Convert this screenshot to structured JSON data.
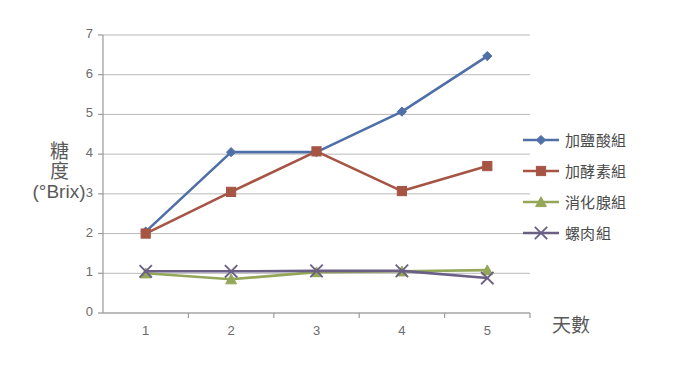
{
  "chart_data": {
    "type": "line",
    "title": "",
    "xlabel": "天數",
    "ylabel": "糖度\n(°Brix)",
    "ylabel_lines": [
      "糖",
      "度",
      "(°Brix)"
    ],
    "x": [
      1,
      2,
      3,
      4,
      5
    ],
    "categories": [
      "1",
      "2",
      "3",
      "4",
      "5"
    ],
    "xtick_labels": [
      "1",
      "2",
      "3",
      "4",
      "5"
    ],
    "ytick_labels": [
      "0",
      "1",
      "2",
      "3",
      "4",
      "5",
      "6",
      "7"
    ],
    "ylim": [
      0,
      7
    ],
    "xlim": [
      0.5,
      5.5
    ],
    "grid": "horizontal",
    "legend_position": "right",
    "series": [
      {
        "name": "加鹽酸組",
        "color": "#4f6fa8",
        "marker": "diamond",
        "values": [
          2.05,
          4.05,
          4.05,
          5.07,
          6.47
        ]
      },
      {
        "name": "加酵素組",
        "color": "#a65545",
        "marker": "square",
        "values": [
          2.0,
          3.05,
          4.07,
          3.07,
          3.7
        ]
      },
      {
        "name": "消化腺組",
        "color": "#94a758",
        "marker": "triangle",
        "values": [
          1.0,
          0.85,
          1.03,
          1.05,
          1.08
        ]
      },
      {
        "name": "螺肉組",
        "color": "#6b5f85",
        "marker": "x",
        "values": [
          1.05,
          1.05,
          1.06,
          1.06,
          0.88
        ]
      }
    ]
  },
  "legend": {
    "items": [
      {
        "label": "加鹽酸組",
        "color": "#4f6fa8",
        "marker": "diamond"
      },
      {
        "label": "加酵素組",
        "color": "#a65545",
        "marker": "square"
      },
      {
        "label": "消化腺組",
        "color": "#94a758",
        "marker": "triangle"
      },
      {
        "label": "螺肉組",
        "color": "#6b5f85",
        "marker": "x"
      }
    ]
  },
  "axes": {
    "y_title_line1": "糖",
    "y_title_line2": "度",
    "y_title_line3": "(°Brix)",
    "x_title": "天數"
  }
}
